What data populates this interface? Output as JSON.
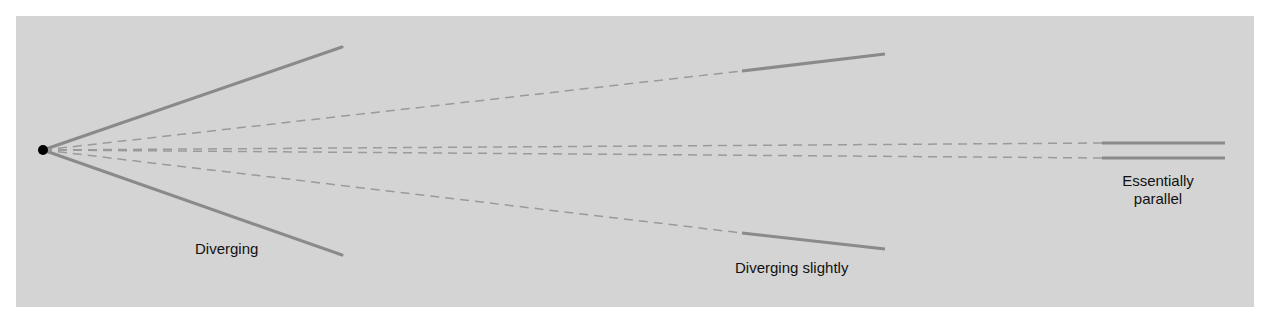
{
  "diagram": {
    "colors": {
      "panel": "#d4d4d4",
      "line": "#8a8a8a",
      "dash": "#9a9a9a",
      "source": "#000000",
      "text": "#111111"
    },
    "source_point": {
      "x": 43,
      "y": 150
    },
    "groups": [
      {
        "id": "diverging",
        "label": "Diverging",
        "solid": [
          [
            [
              43,
              150
            ],
            [
              342,
              47
            ]
          ],
          [
            [
              43,
              150
            ],
            [
              342,
              255
            ]
          ]
        ],
        "label_pos": {
          "x": 195,
          "y": 240
        }
      },
      {
        "id": "slightly",
        "label": "Diverging slightly",
        "dashed": [
          [
            [
              43,
              150
            ],
            [
              742,
              71
            ]
          ],
          [
            [
              43,
              150
            ],
            [
              742,
              233
            ]
          ]
        ],
        "solid": [
          [
            [
              742,
              71
            ],
            [
              885,
              54
            ]
          ],
          [
            [
              742,
              233
            ],
            [
              885,
              249
            ]
          ]
        ],
        "label_pos": {
          "x": 735,
          "y": 259
        }
      },
      {
        "id": "parallel",
        "label_line1": "Essentially",
        "label_line2": "parallel",
        "dashed": [
          [
            [
              43,
              150
            ],
            [
              1102,
              143
            ]
          ],
          [
            [
              43,
              150
            ],
            [
              1102,
              158
            ]
          ]
        ],
        "solid": [
          [
            [
              1102,
              143
            ],
            [
              1225,
              143
            ]
          ],
          [
            [
              1102,
              158
            ],
            [
              1225,
              158
            ]
          ]
        ],
        "label_pos": {
          "x": 1112,
          "y": 172
        }
      }
    ]
  }
}
